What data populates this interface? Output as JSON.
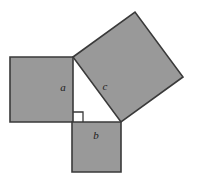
{
  "figure": {
    "canvas": {
      "width": 197,
      "height": 180
    },
    "background_color": "#ffffff",
    "fill_color": "#999999",
    "stroke_color": "#3a3a3a",
    "stroke_width": 1.6,
    "label_color": "#1d1d1d"
  },
  "squares": {
    "a": {
      "label": "a",
      "points": "10,57 73,57 73,122 10,122",
      "label_x": 63,
      "label_y": 88
    },
    "b": {
      "label": "b",
      "points": "72,122 121,122 121,172 72,172",
      "label_x": 96,
      "label_y": 136
    },
    "c": {
      "label": "c",
      "points": "73,57 135,12 183,77 121,122",
      "label_x": 105,
      "label_y": 87
    }
  },
  "right_angle_marker": {
    "name": "right-angle-marker",
    "points": "73,112 83,112 83,122"
  }
}
